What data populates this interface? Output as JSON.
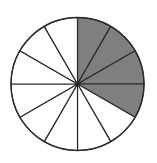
{
  "diagram": {
    "type": "fraction-circle",
    "total_sectors": 12,
    "shaded_sectors": 4,
    "shaded_start": "12 o'clock",
    "direction": "clockwise",
    "fraction": "4/12",
    "colors": {
      "shaded": "#7f7f7f",
      "unshaded": "#ffffff",
      "stroke": "#2a2a2a"
    }
  }
}
